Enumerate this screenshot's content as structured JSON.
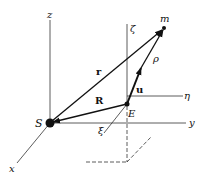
{
  "diagram": {
    "type": "vector-coordinate-diagram",
    "points": {
      "S": {
        "label": "S",
        "x": 50,
        "y": 123
      },
      "E": {
        "label": "E",
        "x": 127,
        "y": 104
      },
      "m": {
        "label": "m",
        "x": 164,
        "y": 28
      }
    },
    "axes": {
      "z": {
        "label": "z"
      },
      "y": {
        "label": "y"
      },
      "x": {
        "label": "x"
      },
      "zeta": {
        "label": "ζ"
      },
      "eta": {
        "label": "η"
      },
      "xi": {
        "label": "ξ"
      }
    },
    "vectors": {
      "r": {
        "label": "r",
        "from": "S",
        "to": "m"
      },
      "R": {
        "label": "R",
        "from": "E",
        "to": "S"
      },
      "u": {
        "label": "u",
        "from": "E",
        "to": "up"
      },
      "rho": {
        "label": "ρ",
        "from": "E",
        "to": "m"
      }
    }
  }
}
